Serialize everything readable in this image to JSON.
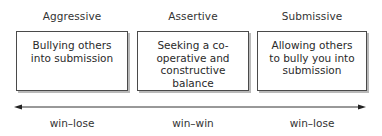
{
  "columns": [
    {
      "heading": "Aggressive",
      "description": "Bullying others into submission",
      "outcome": "win–lose"
    },
    {
      "heading": "Assertive",
      "description": "Seeking a co-operative and constructive balance",
      "outcome": "win–win"
    },
    {
      "heading": "Submissive",
      "description": "Allowing others to bully you into submission",
      "outcome": "win–lose"
    }
  ],
  "axis": {
    "type": "double-headed-arrow"
  }
}
